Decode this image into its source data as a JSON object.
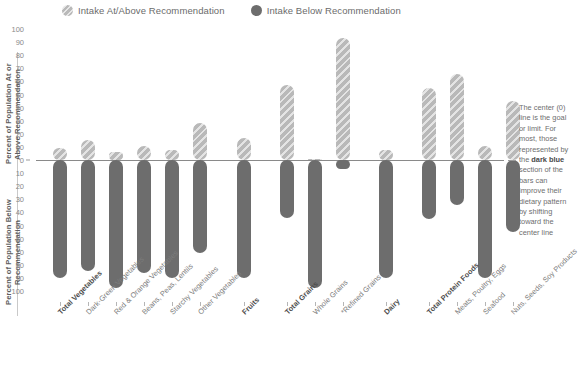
{
  "legend": {
    "items": [
      {
        "label": "Intake At/Above Recommendation",
        "color": "#b9b9b9",
        "icon": "circle-hatched-icon"
      },
      {
        "label": "Intake Below Recommendation",
        "color": "#6d6d6d",
        "icon": "circle-solid-icon"
      }
    ]
  },
  "axis": {
    "title_upper": "Percent of Population At or Above Recommendation",
    "title_lower": "Percent of Population Below Recommendation",
    "ticks_upper": [
      "100",
      "90",
      "80",
      "70",
      "60",
      "50",
      "40",
      "30",
      "20",
      "10",
      "0"
    ],
    "ticks_lower": [
      "10",
      "20",
      "30",
      "40",
      "50",
      "60",
      "70",
      "80",
      "90",
      "100"
    ]
  },
  "note": {
    "line1": "The center (0)",
    "line2": "line is the",
    "line3": "goal or limit.",
    "line4": "For most, those",
    "line5": "represented by",
    "line6": "the ",
    "bold": "dark blue",
    "line7": "section of the",
    "line8": "bars can",
    "line9": "improve their",
    "line10": "dietary pattern",
    "line11": "by shifting",
    "line12": "toward the",
    "line13": "center line"
  },
  "chart_data": {
    "type": "bar",
    "title": "",
    "xlabel": "",
    "ylabel": "Percent of Population",
    "ylim": [
      -100,
      100
    ],
    "grid": false,
    "legend_position": "top",
    "orientation": "vertical-diverging",
    "zero_line_label": "0",
    "categories": [
      "Total Vegetables",
      "Dark-Green Vegetables",
      "Red & Orange Vegetables",
      "Beans, Peas, Lentils",
      "Starchy Vegetables",
      "Other Vegetables",
      "Fruits",
      "Total Grains",
      "Whole Grains",
      "*Refined Grains",
      "Dairy",
      "Total Protein Foods",
      "Meats, Poultry, Eggs",
      "Seafood",
      "Nuts, Seeds, Soy Products"
    ],
    "category_emphasis": [
      true,
      false,
      false,
      false,
      false,
      false,
      true,
      true,
      false,
      false,
      true,
      true,
      false,
      false,
      false
    ],
    "series": [
      {
        "name": "Intake At/Above Recommendation",
        "color": "#b9b9b9",
        "values": [
          9,
          15,
          6,
          11,
          8,
          28,
          17,
          57,
          1,
          93,
          8,
          55,
          66,
          11,
          45
        ]
      },
      {
        "name": "Intake Below Recommendation",
        "color": "#6d6d6d",
        "values": [
          -90,
          -85,
          -98,
          -86,
          -90,
          -71,
          -90,
          -44,
          -98,
          -7,
          -90,
          -45,
          -34,
          -90,
          -55
        ]
      }
    ]
  }
}
